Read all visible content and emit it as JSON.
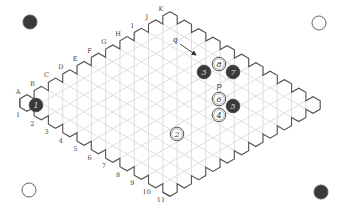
{
  "board": {
    "size": 11,
    "origin": [
      27,
      103
    ],
    "u": [
      14.3,
      -8.3
    ],
    "v": [
      14.3,
      8.5
    ],
    "hex_radius": 8.3,
    "grid_color": "#d6d6d6",
    "edge_color": "#555555",
    "column_labels": [
      "A",
      "B",
      "C",
      "D",
      "E",
      "F",
      "G",
      "H",
      "I",
      "J",
      "K"
    ],
    "row_labels": [
      "1",
      "2",
      "3",
      "4",
      "5",
      "6",
      "7",
      "8",
      "9",
      "10",
      "11"
    ]
  },
  "pieces": [
    {
      "id": "1",
      "color": "black",
      "cell": [
        0,
        0
      ],
      "xy": [
        36,
        105
      ]
    },
    {
      "id": "2",
      "color": "white",
      "cell": [
        5,
        5
      ],
      "xy": [
        177,
        134
      ]
    },
    {
      "id": "3",
      "color": "black",
      "cell": [
        7,
        3
      ],
      "xy": [
        204,
        72
      ]
    },
    {
      "id": "4",
      "color": "white",
      "cell": [
        8,
        6
      ],
      "xy": [
        219,
        115
      ]
    },
    {
      "id": "5",
      "color": "black",
      "cell": [
        8,
        6
      ],
      "xy": [
        233,
        106
      ]
    },
    {
      "id": "6",
      "color": "white",
      "cell": [
        8,
        5
      ],
      "xy": [
        219,
        99
      ]
    },
    {
      "id": "7",
      "color": "black",
      "cell": [
        8,
        3
      ],
      "xy": [
        233,
        72
      ]
    },
    {
      "id": "8",
      "color": "white",
      "cell": [
        8,
        2
      ],
      "xy": [
        219,
        64
      ]
    }
  ],
  "annotations": [
    {
      "text": "q",
      "xy": [
        175,
        42
      ]
    },
    {
      "text": "p",
      "xy": [
        219,
        88
      ]
    }
  ],
  "arrow": {
    "from": [
      180,
      44
    ],
    "to": [
      196,
      55
    ]
  },
  "corner_markers": [
    {
      "color": "black",
      "xy": [
        30,
        22
      ]
    },
    {
      "color": "white",
      "xy": [
        319,
        23
      ]
    },
    {
      "color": "white",
      "xy": [
        29,
        190
      ]
    },
    {
      "color": "black",
      "xy": [
        321,
        192
      ]
    }
  ]
}
